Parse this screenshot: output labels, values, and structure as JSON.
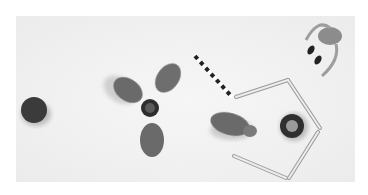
{
  "image": {
    "description": "Grayscale overhead photo of small toys on a white table",
    "objects": [
      {
        "name": "dark-round-disc",
        "label": "Dark round cap"
      },
      {
        "name": "three-lobed-toy",
        "label": "Three-lobed fidget spinner-like toy"
      },
      {
        "name": "striped-stick",
        "label": "Black and white striped stick"
      },
      {
        "name": "pentagon-sticks",
        "label": "Open pentagon made of sticks"
      },
      {
        "name": "round-dish",
        "label": "Round dish with food"
      },
      {
        "name": "hippo-toy",
        "label": "Small hippo figurine"
      },
      {
        "name": "robot-toy",
        "label": "Legged robot toy"
      }
    ],
    "colors": {
      "background": "#ffffff",
      "table": "#efefef",
      "dark": "#3a3a3a",
      "mid": "#6e6e6e"
    }
  }
}
